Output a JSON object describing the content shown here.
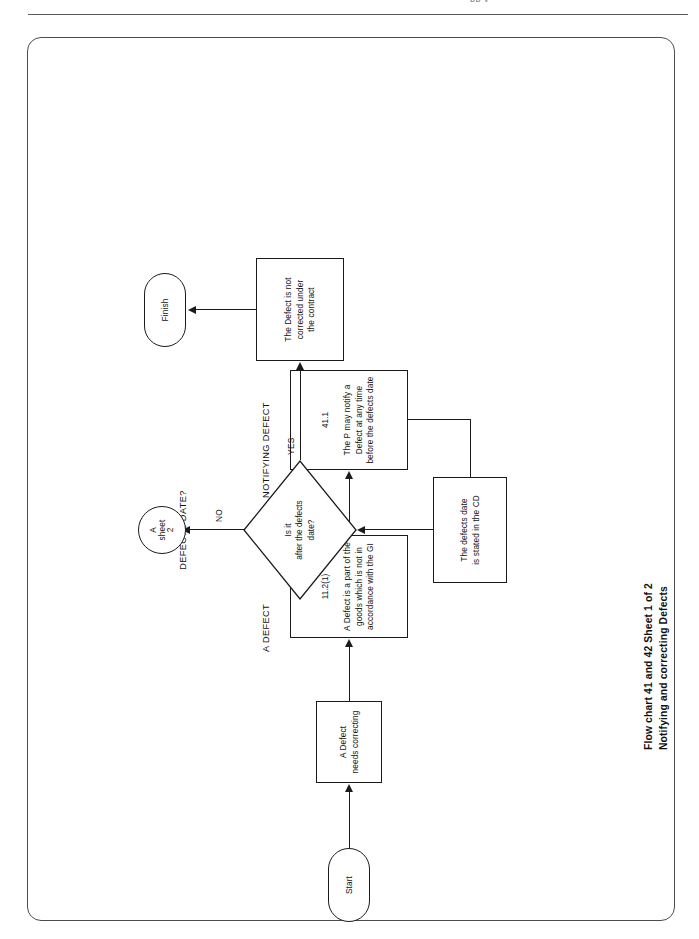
{
  "header": {
    "cut_text": "pp y"
  },
  "caption": {
    "line1": "Flow chart 41 and 42   Sheet 1 of 2",
    "line2": "Notifying and correcting Defects"
  },
  "flow": {
    "group_labels": {
      "a_defect": "A DEFECT",
      "notifying_defect": "NOTIFYING DEFECT",
      "after_defects_date_l1": "AFTER",
      "after_defects_date_l2": "DEFECTS DATE?"
    },
    "nodes": {
      "start": "Start",
      "defect_needs_correcting_l1": "A Defect",
      "defect_needs_correcting_l2": "needs correcting",
      "defect_definition_clause": "11.2(1)",
      "defect_definition_l1": "A Defect is a part of the",
      "defect_definition_l2": "goods which is not in",
      "defect_definition_l3": "accordance with the GI",
      "notify_clause": "41.1",
      "notify_l1": "The P may notify a",
      "notify_l2": "Defect at any time",
      "notify_l3": "before the defects date",
      "defects_date_l1": "The defects date",
      "defects_date_l2": "is stated in the CD",
      "decision_l1": "Is it",
      "decision_l2": "after the defects",
      "decision_l3": "date?",
      "not_corrected_l1": "The Defect is not",
      "not_corrected_l2": "corrected under",
      "not_corrected_l3": "the contract",
      "finish": "Finish",
      "connector_l1": "A",
      "connector_l2": "sheet",
      "connector_l3": "2"
    },
    "branches": {
      "no": "NO",
      "yes": "YES"
    }
  }
}
